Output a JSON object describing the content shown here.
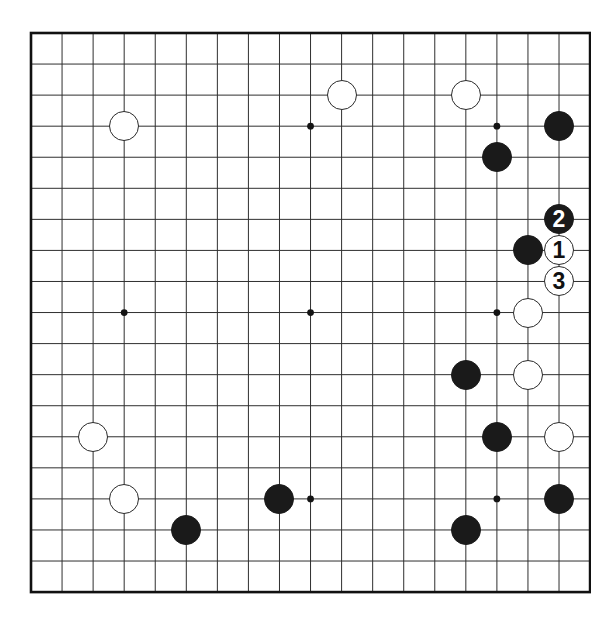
{
  "diagram": {
    "kind": "go-board-diagram",
    "board": {
      "columns": 18,
      "rows": 18,
      "origin_x": 31,
      "origin_y": 33,
      "spacing": 31.06,
      "line_color": "#2f2f2f",
      "border_color": "#111111",
      "border_width": 2.6,
      "line_width": 1.0,
      "background": "#ffffff",
      "stone_radius": 15
    },
    "star_points": [
      {
        "col": 3,
        "row": 3
      },
      {
        "col": 9,
        "row": 3
      },
      {
        "col": 15,
        "row": 3
      },
      {
        "col": 3,
        "row": 9
      },
      {
        "col": 9,
        "row": 9
      },
      {
        "col": 15,
        "row": 9
      },
      {
        "col": 9,
        "row": 15
      },
      {
        "col": 15,
        "row": 15
      }
    ],
    "stones": [
      {
        "col": 10,
        "row": 2,
        "color": "white",
        "label": ""
      },
      {
        "col": 14,
        "row": 2,
        "color": "white",
        "label": ""
      },
      {
        "col": 3,
        "row": 3,
        "color": "white",
        "label": ""
      },
      {
        "col": 17,
        "row": 3,
        "color": "black",
        "label": ""
      },
      {
        "col": 15,
        "row": 4,
        "color": "black",
        "label": ""
      },
      {
        "col": 17,
        "row": 6,
        "color": "black",
        "label": "2"
      },
      {
        "col": 16,
        "row": 7,
        "color": "black",
        "label": ""
      },
      {
        "col": 17,
        "row": 7,
        "color": "white",
        "label": "1"
      },
      {
        "col": 17,
        "row": 8,
        "color": "white",
        "label": "3"
      },
      {
        "col": 16,
        "row": 9,
        "color": "white",
        "label": ""
      },
      {
        "col": 14,
        "row": 11,
        "color": "black",
        "label": ""
      },
      {
        "col": 16,
        "row": 11,
        "color": "white",
        "label": ""
      },
      {
        "col": 2,
        "row": 13,
        "color": "white",
        "label": ""
      },
      {
        "col": 15,
        "row": 13,
        "color": "black",
        "label": ""
      },
      {
        "col": 17,
        "row": 13,
        "color": "white",
        "label": ""
      },
      {
        "col": 3,
        "row": 15,
        "color": "white",
        "label": ""
      },
      {
        "col": 8,
        "row": 15,
        "color": "black",
        "label": ""
      },
      {
        "col": 17,
        "row": 15,
        "color": "black",
        "label": ""
      },
      {
        "col": 5,
        "row": 16,
        "color": "black",
        "label": ""
      },
      {
        "col": 14,
        "row": 16,
        "color": "black",
        "label": ""
      }
    ],
    "move_sequence": [
      {
        "number": "1",
        "color": "white"
      },
      {
        "number": "2",
        "color": "black"
      },
      {
        "number": "3",
        "color": "white"
      }
    ]
  }
}
